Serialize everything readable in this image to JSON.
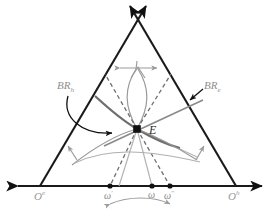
{
  "figure": {
    "colors": {
      "triangle_stroke": "#1a1a1a",
      "axis_stroke": "#1a1a1a",
      "dashed_stroke": "#6f6f6f",
      "gray_curve": "#9a9a9a",
      "dark_gray_line": "#7c7c7c",
      "label_gray": "#8e8e8e",
      "point_fill": "#111111",
      "background": "#ffffff"
    },
    "labels": {
      "br_h": {
        "base": "BR",
        "sub": "h",
        "text": "BR_h"
      },
      "br_e": {
        "base": "BR",
        "sub": "e",
        "text": "BR_e"
      },
      "vertex_left": {
        "base": "O",
        "sup": "e",
        "text": "O^e"
      },
      "vertex_right": {
        "base": "O",
        "sup": "h",
        "text": "O^h"
      },
      "equilibrium": {
        "text": "E"
      },
      "omega_prime": {
        "base": "ω",
        "sup": "′",
        "text": "ω′"
      },
      "omega": {
        "base": "ω",
        "sup": "",
        "text": "ω"
      },
      "omega_double_prime": {
        "base": "ω",
        "sup": "″",
        "text": "ω″"
      }
    },
    "points": {
      "apex": {
        "x": 138,
        "y": 18
      },
      "vertex_left": {
        "x": 40,
        "y": 186
      },
      "vertex_right": {
        "x": 236,
        "y": 186
      },
      "equilibrium": {
        "x": 137,
        "y": 129
      },
      "omega_prime": {
        "x": 110,
        "y": 186
      },
      "omega": {
        "x": 152,
        "y": 186
      },
      "omega_double_prime": {
        "x": 170,
        "y": 186
      }
    },
    "icons": {
      "apex_arrows": "crossing-double-arrow-icon",
      "axis_arrows": "horizontal-double-arrow-icon",
      "top_spread_arrow": "horizontal-spread-arrow-icon",
      "bottom_span_arrow": "curved-double-arrow-icon",
      "pointer_left": "curved-pointer-arrow-icon",
      "pointer_right": "straight-pointer-arrow-icon",
      "shift_left": "small-up-left-arrow-icon",
      "shift_right": "small-up-right-arrow-icon"
    }
  }
}
